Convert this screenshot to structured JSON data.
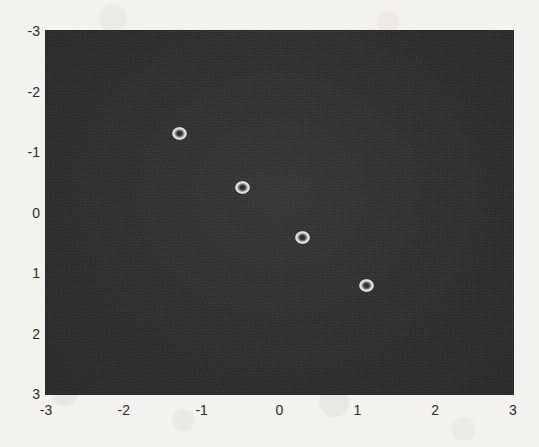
{
  "chart_data": {
    "type": "scatter",
    "title": "",
    "xlabel": "",
    "ylabel": "",
    "xlim": [
      -3,
      3
    ],
    "ylim": [
      -3,
      3
    ],
    "y_axis_inverted": true,
    "grid": false,
    "legend": null,
    "background_color": "#2e2e2e",
    "marker_color": "#e6e6e6",
    "marker_style": "open-circle",
    "xticks": [
      "-3",
      "-2",
      "-1",
      "0",
      "1",
      "2",
      "3"
    ],
    "xtick_values": [
      -3,
      -2,
      -1,
      0,
      1,
      2,
      3
    ],
    "yticks": [
      "-3",
      "-2",
      "-1",
      "0",
      "1",
      "2",
      "3"
    ],
    "ytick_values": [
      -3,
      -2,
      -1,
      0,
      1,
      2,
      3
    ],
    "points": [
      {
        "x": -1.28,
        "y": -1.3
      },
      {
        "x": -0.47,
        "y": -0.42
      },
      {
        "x": 0.3,
        "y": 0.42
      },
      {
        "x": 1.12,
        "y": 1.21
      }
    ]
  }
}
